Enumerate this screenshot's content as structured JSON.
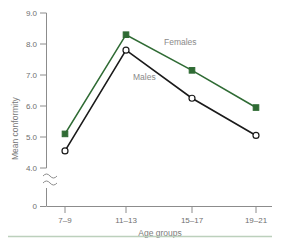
{
  "chart_data": {
    "type": "line",
    "title": "",
    "xlabel": "Age groups",
    "ylabel": "Mean conformity",
    "categories": [
      "7–9",
      "11–13",
      "15–17",
      "19–21"
    ],
    "yticks": [
      "0",
      "4.0",
      "5.0",
      "6.0",
      "7.0",
      "8.0",
      "9.0"
    ],
    "ylim": [
      4.0,
      9.0
    ],
    "axis_break": true,
    "axis_break_symbol": "≈",
    "grid": false,
    "legend_position": "inline-annotation",
    "series": [
      {
        "name": "Females",
        "color": "#2f6b34",
        "marker": "filled-square",
        "values": [
          5.1,
          8.3,
          7.15,
          5.95
        ]
      },
      {
        "name": "Males",
        "color": "#1a1a1a",
        "marker": "open-circle",
        "values": [
          4.55,
          7.8,
          6.25,
          5.05
        ]
      }
    ],
    "annotations": [
      {
        "text": "Females",
        "series": "Females",
        "x": 164,
        "y": 45
      },
      {
        "text": "Males",
        "series": "Males",
        "x": 133,
        "y": 80
      }
    ]
  },
  "colors": {
    "females": "#2f6b34",
    "males": "#1a1a1a",
    "axis": "#8c8c8c",
    "tick_text": "#6f6f6f",
    "annotation_text": "#8a8a8a",
    "footer_rule": "#bcd0bc"
  },
  "footer": {
    "rule_label": "footer-divider"
  }
}
